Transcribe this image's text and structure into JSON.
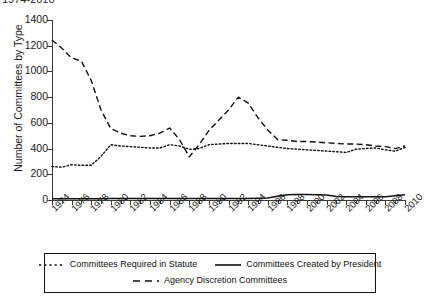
{
  "title": "1974-2010",
  "axes": {
    "ylabel": "Number of Committees by Type",
    "xlabel": "",
    "yticks": [
      0,
      200,
      400,
      600,
      800,
      1000,
      1200,
      1400
    ],
    "ylim": [
      0,
      1400
    ],
    "xlim": [
      1974,
      2010
    ],
    "xticklabels": [
      "1974",
      "1976",
      "1978",
      "1980",
      "1982",
      "1984",
      "1986",
      "1988",
      "1990",
      "1992",
      "1994",
      "1996",
      "1998",
      "2000",
      "2002",
      "2004",
      "2006",
      "2008",
      "2010"
    ]
  },
  "legend": {
    "items": [
      {
        "label": "Committees Required in Statute",
        "style": "dotted",
        "color": "#111111"
      },
      {
        "label": "Committees Created by President",
        "style": "solid",
        "color": "#111111"
      },
      {
        "label": "Agency Discretion Committees",
        "style": "dashed",
        "color": "#111111"
      }
    ],
    "position": "below-axes"
  },
  "chart_data": {
    "type": "line",
    "title": "1974-2010",
    "xlabel": "",
    "ylabel": "Number of Committees by Type",
    "ylim": [
      0,
      1400
    ],
    "xlim": [
      1974,
      2010
    ],
    "grid": false,
    "legend_position": "below-axes",
    "x": [
      1974,
      1975,
      1976,
      1977,
      1978,
      1979,
      1980,
      1981,
      1982,
      1983,
      1984,
      1985,
      1986,
      1987,
      1988,
      1989,
      1990,
      1991,
      1992,
      1993,
      1994,
      1995,
      1996,
      1997,
      1998,
      1999,
      2000,
      2001,
      2002,
      2003,
      2004,
      2005,
      2006,
      2007,
      2008,
      2009,
      2010
    ],
    "series": [
      {
        "name": "Agency Discretion Committees",
        "style": "dashed",
        "color": "#111111",
        "values": [
          1245,
          1180,
          1105,
          1080,
          930,
          700,
          555,
          520,
          500,
          495,
          500,
          520,
          560,
          470,
          335,
          430,
          540,
          620,
          700,
          800,
          755,
          640,
          545,
          470,
          465,
          455,
          455,
          450,
          445,
          440,
          435,
          435,
          430,
          420,
          415,
          400,
          420
        ]
      },
      {
        "name": "Committees Required in Statute",
        "style": "dotted",
        "color": "#111111",
        "values": [
          260,
          255,
          275,
          270,
          270,
          340,
          430,
          420,
          415,
          410,
          405,
          405,
          430,
          420,
          395,
          400,
          430,
          435,
          440,
          440,
          440,
          430,
          420,
          410,
          400,
          395,
          390,
          385,
          380,
          375,
          370,
          395,
          400,
          405,
          390,
          380,
          410
        ]
      },
      {
        "name": "Committees Created by President",
        "style": "solid",
        "color": "#111111",
        "values": [
          10,
          10,
          10,
          10,
          10,
          10,
          12,
          12,
          12,
          12,
          12,
          12,
          12,
          12,
          12,
          12,
          12,
          12,
          12,
          12,
          12,
          14,
          16,
          30,
          40,
          42,
          42,
          40,
          38,
          28,
          26,
          25,
          25,
          25,
          26,
          34,
          40
        ]
      }
    ]
  }
}
